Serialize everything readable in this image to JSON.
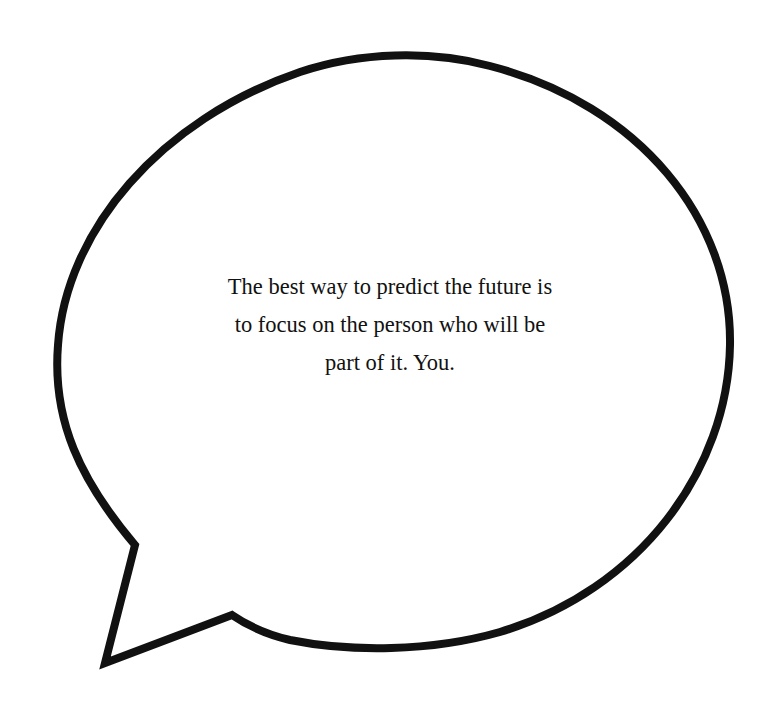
{
  "speech_bubble": {
    "shape": "speech-bubble-with-tail",
    "fill_color": "#ffffff",
    "stroke_color": "#111111",
    "quote": {
      "lines": [
        "The best way to predict the future is",
        "to focus on the person who will be",
        "part of it. You."
      ]
    }
  }
}
